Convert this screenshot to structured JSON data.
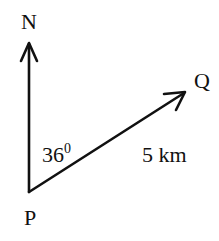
{
  "diagram": {
    "type": "bearing-diagram",
    "labels": {
      "north": "N",
      "start": "P",
      "end": "Q",
      "angle": "36",
      "angle_unit": "0",
      "distance": "5 km"
    },
    "colors": {
      "line": "#111111",
      "background": "#ffffff"
    }
  }
}
